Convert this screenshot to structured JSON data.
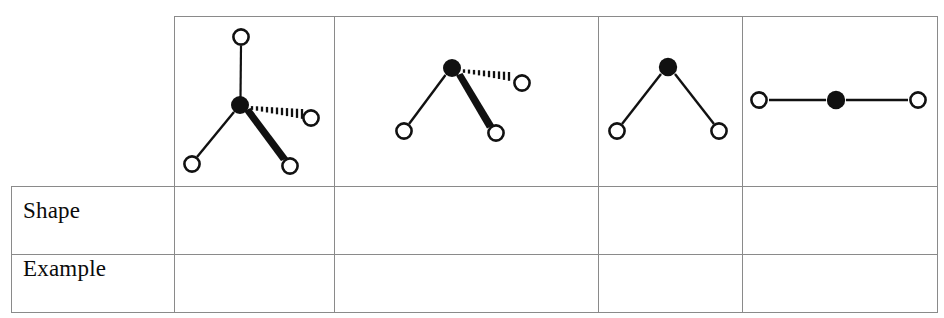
{
  "page": {
    "width": 944,
    "height": 318,
    "background": "#ffffff",
    "cropped_header_text": "",
    "line_color": "#8a8a8a",
    "ink_color": "#111111"
  },
  "table": {
    "name": "molecular-geometry-table",
    "left": 11,
    "top": 16,
    "right": 938,
    "bottom": 312,
    "column_dividers_x": [
      174,
      334,
      598,
      742
    ],
    "row_dividers_y": [
      186,
      254
    ],
    "row_labels": [
      {
        "key": "shape",
        "label": "Shape",
        "value": ""
      },
      {
        "key": "example",
        "label": "Example",
        "value": ""
      }
    ],
    "columns": [
      {
        "key": "col-label",
        "label": "",
        "x0": 11,
        "x1": 174
      },
      {
        "key": "col-1",
        "label": "",
        "x0": 174,
        "x1": 334
      },
      {
        "key": "col-2",
        "label": "",
        "x0": 334,
        "x1": 598
      },
      {
        "key": "col-3",
        "label": "",
        "x0": 598,
        "x1": 742
      },
      {
        "key": "col-4",
        "label": "",
        "x0": 742,
        "x1": 938
      }
    ]
  },
  "diagrams": [
    {
      "id": "diagram-1",
      "name": "molecule-diagram-four-bonds",
      "caption": "",
      "cell": {
        "x0": 174,
        "x1": 334,
        "y0": 16,
        "y1": 186
      },
      "center": {
        "x": 240,
        "y": 105,
        "r": 9,
        "fill": "#111111"
      },
      "atoms": [
        {
          "id": "a1",
          "x": 241,
          "y": 37,
          "r": 8
        },
        {
          "id": "a2",
          "x": 311,
          "y": 118,
          "r": 8
        },
        {
          "id": "a3",
          "x": 192,
          "y": 164,
          "r": 8
        },
        {
          "id": "a4",
          "x": 290,
          "y": 166,
          "r": 8
        }
      ],
      "bonds": [
        {
          "to": "a1",
          "type": "plain"
        },
        {
          "to": "a2",
          "type": "hashed-wedge"
        },
        {
          "to": "a3",
          "type": "plain"
        },
        {
          "to": "a4",
          "type": "solid-wedge"
        }
      ]
    },
    {
      "id": "diagram-2",
      "name": "molecule-diagram-three-bonds",
      "caption": "",
      "cell": {
        "x0": 334,
        "x1": 598,
        "y0": 16,
        "y1": 186
      },
      "center": {
        "x": 452,
        "y": 68,
        "r": 9,
        "fill": "#111111"
      },
      "atoms": [
        {
          "id": "b1",
          "x": 522,
          "y": 83,
          "r": 8
        },
        {
          "id": "b2",
          "x": 404,
          "y": 131,
          "r": 8
        },
        {
          "id": "b3",
          "x": 496,
          "y": 133,
          "r": 8
        }
      ],
      "bonds": [
        {
          "to": "b1",
          "type": "hashed-wedge"
        },
        {
          "to": "b2",
          "type": "plain"
        },
        {
          "to": "b3",
          "type": "solid-wedge"
        }
      ]
    },
    {
      "id": "diagram-3",
      "name": "molecule-diagram-bent",
      "caption": "",
      "cell": {
        "x0": 598,
        "x1": 742,
        "y0": 16,
        "y1": 186
      },
      "center": {
        "x": 668,
        "y": 67,
        "r": 9,
        "fill": "#111111"
      },
      "atoms": [
        {
          "id": "c1",
          "x": 617,
          "y": 131,
          "r": 8
        },
        {
          "id": "c2",
          "x": 719,
          "y": 131,
          "r": 8
        }
      ],
      "bonds": [
        {
          "to": "c1",
          "type": "plain"
        },
        {
          "to": "c2",
          "type": "plain"
        }
      ]
    },
    {
      "id": "diagram-4",
      "name": "molecule-diagram-linear",
      "caption": "",
      "cell": {
        "x0": 742,
        "x1": 938,
        "y0": 16,
        "y1": 186
      },
      "center": {
        "x": 836,
        "y": 100,
        "r": 9,
        "fill": "#111111"
      },
      "atoms": [
        {
          "id": "d1",
          "x": 759,
          "y": 100,
          "r": 8
        },
        {
          "id": "d2",
          "x": 918,
          "y": 100,
          "r": 8
        }
      ],
      "bonds": [
        {
          "to": "d1",
          "type": "plain"
        },
        {
          "to": "d2",
          "type": "plain"
        }
      ]
    }
  ],
  "legend": {
    "open_circle_meaning": "",
    "filled_circle_meaning": "",
    "solid_wedge_meaning": "",
    "hashed_wedge_meaning": ""
  }
}
